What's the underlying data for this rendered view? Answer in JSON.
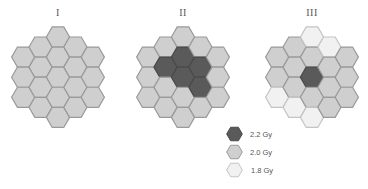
{
  "figure": {
    "panels": [
      {
        "title": "I",
        "center_x": 58,
        "columns": [
          [
            "2.0 Gy",
            "2.0 Gy",
            "2.0 Gy"
          ],
          [
            "2.0 Gy",
            "2.0 Gy",
            "2.0 Gy",
            "2.0 Gy"
          ],
          [
            "2.0 Gy",
            "2.0 Gy",
            "2.0 Gy",
            "2.0 Gy",
            "2.0 Gy"
          ],
          [
            "2.0 Gy",
            "2.0 Gy",
            "2.0 Gy",
            "2.0 Gy"
          ],
          [
            "2.0 Gy",
            "2.0 Gy",
            "2.0 Gy"
          ]
        ]
      },
      {
        "title": "II",
        "center_x": 183,
        "columns": [
          [
            "2.0 Gy",
            "2.0 Gy",
            "2.0 Gy"
          ],
          [
            "2.0 Gy",
            "2.2 Gy",
            "2.0 Gy",
            "2.0 Gy"
          ],
          [
            "2.0 Gy",
            "2.2 Gy",
            "2.2 Gy",
            "2.0 Gy",
            "2.0 Gy"
          ],
          [
            "2.0 Gy",
            "2.2 Gy",
            "2.2 Gy",
            "2.0 Gy"
          ],
          [
            "2.0 Gy",
            "2.0 Gy",
            "2.0 Gy"
          ]
        ]
      },
      {
        "title": "III",
        "center_x": 312,
        "columns": [
          [
            "2.0 Gy",
            "2.0 Gy",
            "1.8 Gy"
          ],
          [
            "2.0 Gy",
            "2.0 Gy",
            "2.0 Gy",
            "1.8 Gy"
          ],
          [
            "1.8 Gy",
            "2.0 Gy",
            "2.2 Gy",
            "2.0 Gy",
            "1.8 Gy"
          ],
          [
            "1.8 Gy",
            "2.0 Gy",
            "2.0 Gy",
            "2.0 Gy"
          ],
          [
            "2.0 Gy",
            "2.0 Gy",
            "2.0 Gy"
          ]
        ]
      }
    ],
    "legend": [
      {
        "label": "2.2 Gy",
        "fill": "#5a5a5a",
        "stroke": "#4a4a4a"
      },
      {
        "label": "2.0 Gy",
        "fill": "#cfcfcf",
        "stroke": "#9a9a9a"
      },
      {
        "label": "1.8 Gy",
        "fill": "#f1f1f1",
        "stroke": "#c4c4c4"
      }
    ]
  }
}
